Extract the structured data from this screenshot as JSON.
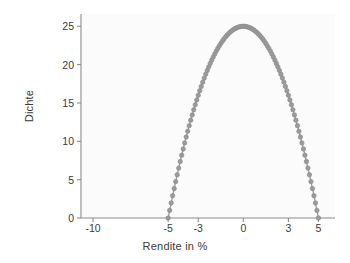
{
  "chart_data": {
    "type": "scatter",
    "title": "",
    "xlabel": "Rendite in %",
    "ylabel": "Dichte",
    "xlim": [
      -10.8,
      6.1
    ],
    "ylim": [
      0,
      26.6
    ],
    "xticks": [
      -10,
      -5,
      -3,
      0,
      3,
      5
    ],
    "xtick_labels": [
      "-10",
      "-5",
      "-3",
      "0",
      "3",
      "5"
    ],
    "yticks": [
      0,
      5,
      10,
      15,
      20,
      25
    ],
    "ytick_labels": [
      "0",
      "5",
      "10",
      "15",
      "20",
      "25"
    ],
    "grid": false,
    "legend": null,
    "marker": "circle",
    "marker_color": "#9b9b9b",
    "marker_edge_color": "#8d8d8d",
    "marker_size": 3.4,
    "line_color": "#9b9b9b",
    "axis_color": "#8c8c8c",
    "plot_background": "#fbfbfb",
    "figure_background": "#ffffff",
    "text_color": "#3a3a3a",
    "series": [
      {
        "name": "Dichte",
        "x": [
          -5.0,
          -4.9,
          -4.8,
          -4.7,
          -4.6,
          -4.5,
          -4.4,
          -4.3,
          -4.2,
          -4.1,
          -4.0,
          -3.9,
          -3.8,
          -3.7,
          -3.6,
          -3.5,
          -3.4,
          -3.3,
          -3.2,
          -3.1,
          -3.0,
          -2.9,
          -2.8,
          -2.7,
          -2.6,
          -2.5,
          -2.4,
          -2.3,
          -2.2,
          -2.1,
          -2.0,
          -1.9,
          -1.8,
          -1.7,
          -1.6,
          -1.5,
          -1.4,
          -1.3,
          -1.2,
          -1.1,
          -1.0,
          -0.9,
          -0.8,
          -0.7,
          -0.6,
          -0.5,
          -0.4,
          -0.3,
          -0.2,
          -0.1,
          0.0,
          0.1,
          0.2,
          0.3,
          0.4,
          0.5,
          0.6,
          0.7,
          0.8,
          0.9,
          1.0,
          1.1,
          1.2,
          1.3,
          1.4,
          1.5,
          1.6,
          1.7,
          1.8,
          1.9,
          2.0,
          2.1,
          2.2,
          2.3,
          2.4,
          2.5,
          2.6,
          2.7,
          2.8,
          2.9,
          3.0,
          3.1,
          3.2,
          3.3,
          3.4,
          3.5,
          3.6,
          3.7,
          3.8,
          3.9,
          4.0,
          4.1,
          4.2,
          4.3,
          4.4,
          4.5,
          4.6,
          4.7,
          4.8,
          4.9,
          5.0
        ],
        "y": [
          0.0,
          0.99,
          1.96,
          2.91,
          3.84,
          4.75,
          5.64,
          6.51,
          7.36,
          8.19,
          9.0,
          9.79,
          10.56,
          11.31,
          12.04,
          12.75,
          13.44,
          14.11,
          14.76,
          15.39,
          16.0,
          16.59,
          17.16,
          17.71,
          18.24,
          18.75,
          19.24,
          19.71,
          20.16,
          20.59,
          21.0,
          21.39,
          21.76,
          22.11,
          22.44,
          22.75,
          23.04,
          23.31,
          23.56,
          23.79,
          24.0,
          24.19,
          24.36,
          24.51,
          24.64,
          24.75,
          24.84,
          24.91,
          24.96,
          24.99,
          25.0,
          24.99,
          24.96,
          24.91,
          24.84,
          24.75,
          24.64,
          24.51,
          24.36,
          24.19,
          24.0,
          23.79,
          23.56,
          23.31,
          23.04,
          22.75,
          22.44,
          22.11,
          21.76,
          21.39,
          21.0,
          20.59,
          20.16,
          19.71,
          19.24,
          18.75,
          18.24,
          17.71,
          17.16,
          16.59,
          16.0,
          15.39,
          14.76,
          14.11,
          13.44,
          12.75,
          12.04,
          11.31,
          10.56,
          9.79,
          9.0,
          8.19,
          7.36,
          6.51,
          5.64,
          4.75,
          3.84,
          2.91,
          1.96,
          0.99,
          0.0
        ]
      }
    ]
  }
}
